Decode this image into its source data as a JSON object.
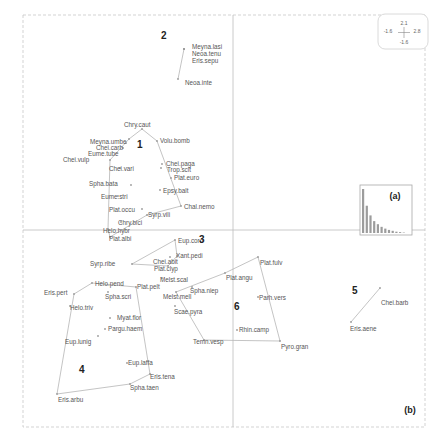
{
  "chart_data": {
    "type": "scatter",
    "title": "",
    "xlabel": "",
    "ylabel": "",
    "panel_label": "(b)",
    "grid": false,
    "scale_box": {
      "top": "2.1",
      "left": "-1.6",
      "right": "2.8",
      "bottom": "-1.6"
    },
    "axes_origin": {
      "x_px": 233,
      "y_px": 230
    },
    "groups": [
      {
        "id": "1",
        "label_pos": [
          137,
          148
        ],
        "species": [
          {
            "name": "Chry.caut",
            "x": 142,
            "y": 129,
            "lx": 124,
            "ly": 127
          },
          {
            "name": "Volu.bomb",
            "x": 157,
            "y": 141,
            "lx": 160,
            "ly": 143
          },
          {
            "name": "Meyna.umbe",
            "x": 129,
            "y": 139,
            "lx": 90,
            "ly": 144
          },
          {
            "name": "Chei.carb",
            "x": 126,
            "y": 143,
            "lx": 96,
            "ly": 150
          },
          {
            "name": "Eume.tube",
            "x": 123,
            "y": 148,
            "lx": 88,
            "ly": 156
          },
          {
            "name": "Chei.vulp",
            "x": 110,
            "y": 160,
            "lx": 63,
            "ly": 162
          },
          {
            "name": "Chei.vari",
            "x": 120,
            "y": 168,
            "lx": 109,
            "ly": 171
          },
          {
            "name": "Chei.paga",
            "x": 162,
            "y": 164,
            "lx": 166,
            "ly": 166
          },
          {
            "name": "Trop.scit",
            "x": 161,
            "y": 168,
            "lx": 167,
            "ly": 172
          },
          {
            "name": "Plat.euro",
            "x": 171,
            "y": 178,
            "lx": 174,
            "ly": 180
          },
          {
            "name": "Epsy.balt",
            "x": 160,
            "y": 190,
            "lx": 163,
            "ly": 193
          },
          {
            "name": "Spha.bata",
            "x": 131,
            "y": 185,
            "lx": 89,
            "ly": 186
          },
          {
            "name": "Eume.stri",
            "x": 118,
            "y": 196,
            "lx": 101,
            "ly": 199
          },
          {
            "name": "Chal.nemo",
            "x": 181,
            "y": 206,
            "lx": 184,
            "ly": 209
          },
          {
            "name": "Plat.occu",
            "x": 142,
            "y": 209,
            "lx": 109,
            "ly": 212
          },
          {
            "name": "Syrp.vili",
            "x": 147,
            "y": 215,
            "lx": 148,
            "ly": 217
          },
          {
            "name": "Chry.bici",
            "x": 121,
            "y": 222,
            "lx": 118,
            "ly": 225
          },
          {
            "name": "Helo.hybr",
            "x": 108,
            "y": 229,
            "lx": 103,
            "ly": 233
          },
          {
            "name": "Plat.albi",
            "x": 110,
            "y": 237,
            "lx": 109,
            "ly": 241
          }
        ]
      },
      {
        "id": "2",
        "label_pos": [
          161,
          39
        ],
        "species": [
          {
            "name": "Meyna.lasi",
            "x": 184,
            "y": 49,
            "lx": 192,
            "ly": 49
          },
          {
            "name": "Neoa.tenu",
            "x": 184,
            "y": 49,
            "lx": 192,
            "ly": 56
          },
          {
            "name": "Eris.sepu",
            "x": 184,
            "y": 49,
            "lx": 192,
            "ly": 63
          },
          {
            "name": "Neoa.inte",
            "x": 178,
            "y": 79,
            "lx": 185,
            "ly": 85
          }
        ]
      },
      {
        "id": "3",
        "label_pos": [
          199,
          243
        ],
        "species": [
          {
            "name": "Eup.coro",
            "x": 175,
            "y": 240,
            "lx": 178,
            "ly": 243
          },
          {
            "name": "Xant.pedi",
            "x": 177,
            "y": 256,
            "lx": 176,
            "ly": 258
          },
          {
            "name": "Chei.abit",
            "x": 170,
            "y": 257,
            "lx": 153,
            "ly": 264
          },
          {
            "name": "Plat.clyp",
            "x": 168,
            "y": 266,
            "lx": 154,
            "ly": 271
          },
          {
            "name": "Syrp.ribe",
            "x": 132,
            "y": 264,
            "lx": 90,
            "ly": 266
          },
          {
            "name": "Melst.scal",
            "x": 162,
            "y": 278,
            "lx": 160,
            "ly": 282
          }
        ]
      },
      {
        "id": "4",
        "label_pos": [
          79,
          373
        ],
        "species": [
          {
            "name": "Eris.pert",
            "x": 74,
            "y": 294,
            "lx": 44,
            "ly": 295
          },
          {
            "name": "Helo.pend",
            "x": 92,
            "y": 283,
            "lx": 95,
            "ly": 286
          },
          {
            "name": "Plat.pelt",
            "x": 136,
            "y": 287,
            "lx": 137,
            "ly": 289
          },
          {
            "name": "Spha.scri",
            "x": 108,
            "y": 292,
            "lx": 105,
            "ly": 299
          },
          {
            "name": "Helo.triv",
            "x": 70,
            "y": 306,
            "lx": 70,
            "ly": 310
          },
          {
            "name": "Myat.flor",
            "x": 110,
            "y": 318,
            "lx": 117,
            "ly": 320
          },
          {
            "name": "Pargu.haem",
            "x": 105,
            "y": 329,
            "lx": 108,
            "ly": 331
          },
          {
            "name": "Eup.lunig",
            "x": 98,
            "y": 336,
            "lx": 65,
            "ly": 344
          },
          {
            "name": "Eup.laffa",
            "x": 127,
            "y": 363,
            "lx": 128,
            "ly": 365
          },
          {
            "name": "Eris.tena",
            "x": 150,
            "y": 374,
            "lx": 150,
            "ly": 379
          },
          {
            "name": "Spha.taen",
            "x": 130,
            "y": 384,
            "lx": 130,
            "ly": 390
          },
          {
            "name": "Eris.arbu",
            "x": 57,
            "y": 394,
            "lx": 58,
            "ly": 402
          }
        ]
      },
      {
        "id": "5",
        "label_pos": [
          352,
          294
        ],
        "species": [
          {
            "name": "Chei.barb",
            "x": 380,
            "y": 288,
            "lx": 381,
            "ly": 305
          },
          {
            "name": "Eris.aene",
            "x": 351,
            "y": 322,
            "lx": 350,
            "ly": 331
          }
        ]
      },
      {
        "id": "6",
        "label_pos": [
          234,
          310
        ],
        "species": [
          {
            "name": "Plat.fulv",
            "x": 258,
            "y": 257,
            "lx": 260,
            "ly": 265
          },
          {
            "name": "Plat.angu",
            "x": 225,
            "y": 273,
            "lx": 226,
            "ly": 280
          },
          {
            "name": "Spha.niep",
            "x": 192,
            "y": 287,
            "lx": 190,
            "ly": 293
          },
          {
            "name": "Melst.mell",
            "x": 176,
            "y": 292,
            "lx": 163,
            "ly": 299
          },
          {
            "name": "Parh.vers",
            "x": 258,
            "y": 297,
            "lx": 259,
            "ly": 300
          },
          {
            "name": "Scae.pyra",
            "x": 175,
            "y": 306,
            "lx": 174,
            "ly": 314
          },
          {
            "name": "Rhin.camp",
            "x": 237,
            "y": 330,
            "lx": 239,
            "ly": 332
          },
          {
            "name": "Temn.vesp",
            "x": 204,
            "y": 340,
            "lx": 193,
            "ly": 344
          },
          {
            "name": "Pyro.gran",
            "x": 280,
            "y": 341,
            "lx": 281,
            "ly": 349
          }
        ]
      }
    ],
    "hulls": {
      "1": [
        [
          142,
          129
        ],
        [
          157,
          141
        ],
        [
          181,
          206
        ],
        [
          147,
          215
        ],
        [
          110,
          237
        ],
        [
          108,
          229
        ],
        [
          110,
          160
        ],
        [
          129,
          139
        ]
      ],
      "2": [
        [
          184,
          49
        ],
        [
          178,
          79
        ]
      ],
      "3": [
        [
          175,
          240
        ],
        [
          177,
          256
        ],
        [
          168,
          266
        ],
        [
          132,
          264
        ]
      ],
      "4": [
        [
          92,
          283
        ],
        [
          136,
          287
        ],
        [
          150,
          374
        ],
        [
          130,
          384
        ],
        [
          57,
          394
        ],
        [
          74,
          294
        ]
      ],
      "5": [
        [
          380,
          288
        ],
        [
          351,
          322
        ]
      ],
      "6": [
        [
          258,
          257
        ],
        [
          280,
          341
        ],
        [
          204,
          340
        ],
        [
          176,
          292
        ],
        [
          225,
          273
        ]
      ]
    },
    "inset": {
      "label": "(a)",
      "type": "bar",
      "description": "eigenvalue scree plot",
      "values": [
        100,
        62,
        40,
        27,
        20,
        14,
        10,
        7,
        5,
        3,
        2,
        1
      ]
    }
  }
}
